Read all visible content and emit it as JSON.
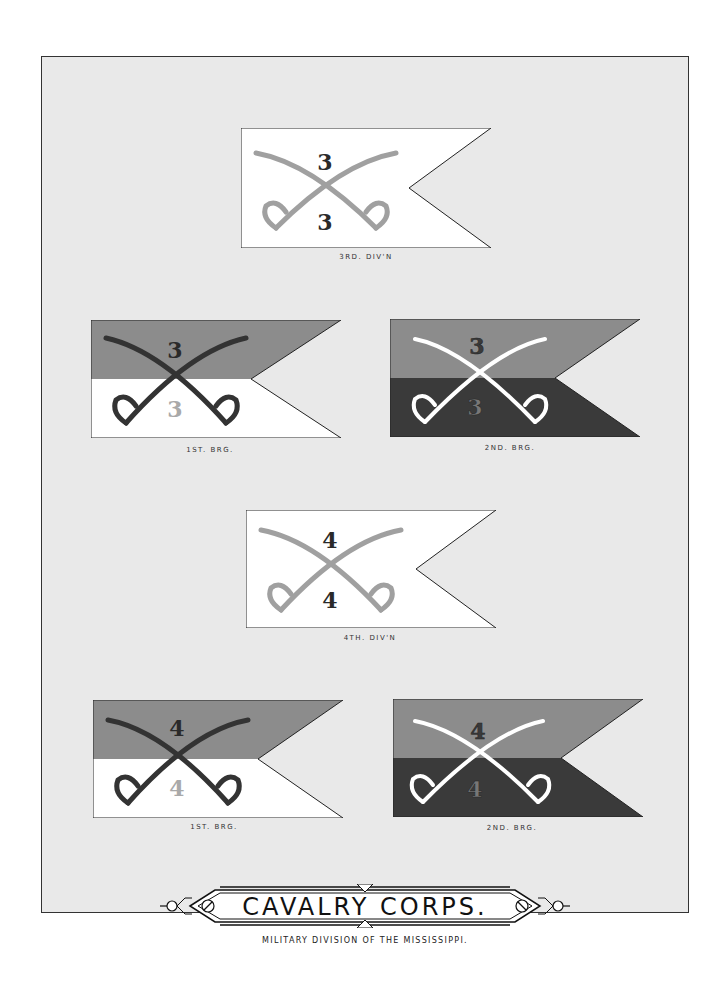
{
  "plate": {
    "title": "CAVALRY CORPS.",
    "subtitle": "MILITARY DIVISION OF THE MISSISSIPPI."
  },
  "flags": [
    {
      "caption": "3RD. DIV'N",
      "upper_number": "3",
      "lower_number": "3",
      "type": "division"
    },
    {
      "caption": "1ST. BRG.",
      "upper_number": "3",
      "lower_number": "3",
      "type": "first-brigade"
    },
    {
      "caption": "2ND. BRG.",
      "upper_number": "3",
      "lower_number": "3",
      "type": "second-brigade"
    },
    {
      "caption": "4TH. DIV'N",
      "upper_number": "4",
      "lower_number": "4",
      "type": "division"
    },
    {
      "caption": "1ST. BRG.",
      "upper_number": "4",
      "lower_number": "4",
      "type": "first-brigade"
    },
    {
      "caption": "2ND. BRG.",
      "upper_number": "4",
      "lower_number": "4",
      "type": "second-brigade"
    }
  ],
  "colors": {
    "plate_bg": "#e9e9e9",
    "white": "#ffffff",
    "upper_gray": "#8c8c8c",
    "lower_dark": "#3a3a3a",
    "saber_gray": "#a0a0a0",
    "saber_dark": "#333333",
    "number_dark": "#2a2a2a",
    "number_light": "#a9a9a9"
  }
}
